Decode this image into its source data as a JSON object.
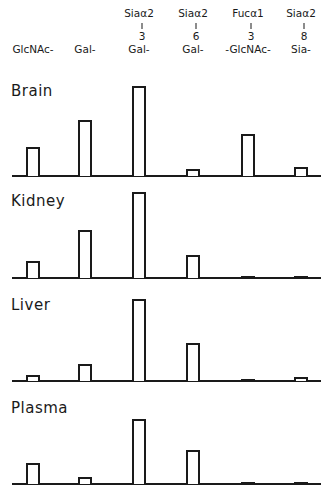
{
  "chart_data": {
    "type": "bar",
    "title": "",
    "xlabel": "",
    "ylabel": "",
    "grid": false,
    "legend": null,
    "categories": [
      {
        "top": "",
        "linkage": "",
        "label": "GlcNAc-"
      },
      {
        "top": "",
        "linkage": "",
        "label": "Gal-"
      },
      {
        "top": "Siaα2",
        "linkage": "3",
        "label": "Gal-"
      },
      {
        "top": "Siaα2",
        "linkage": "6",
        "label": "Gal-"
      },
      {
        "top": "Fucα1",
        "linkage": "3",
        "label": "-GlcNAc-"
      },
      {
        "top": "Siaα2",
        "linkage": "8",
        "label": "Sia-"
      }
    ],
    "panels": [
      {
        "name": "Brain",
        "values": [
          29,
          56,
          90,
          7,
          42,
          9
        ]
      },
      {
        "name": "Kidney",
        "values": [
          17,
          48,
          86,
          23,
          1,
          1
        ]
      },
      {
        "name": "Liver",
        "values": [
          6,
          17,
          82,
          38,
          1,
          4
        ]
      },
      {
        "name": "Plasma",
        "values": [
          21,
          7,
          65,
          34,
          1,
          1
        ]
      }
    ],
    "units": "relative bar height (px, no axis shown)"
  }
}
